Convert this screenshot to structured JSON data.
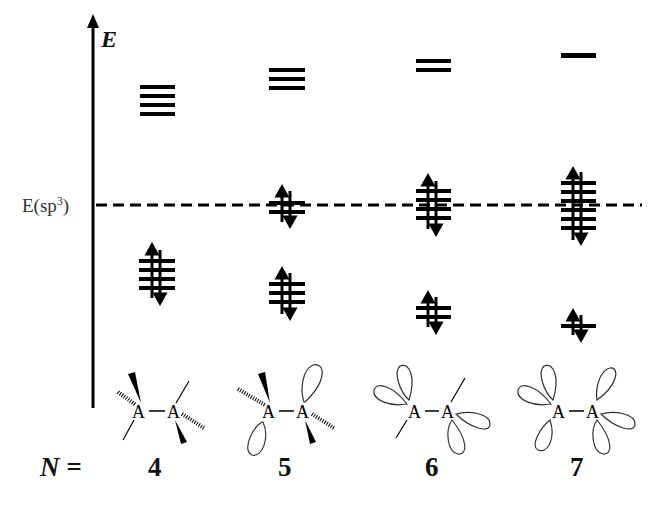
{
  "diagram": {
    "axis_label": "E",
    "reference_level": {
      "label_prefix": "E(sp",
      "label_sup": "3",
      "label_suffix": ")"
    },
    "n_label": "N =",
    "columns": [
      {
        "n": "4",
        "upper_levels": 4,
        "middle_levels": 0,
        "lower_levels": 4,
        "structure": "4 bonds (2 wedge, 2 hash, 2 plain), no lone pairs"
      },
      {
        "n": "5",
        "upper_levels": 3,
        "middle_levels": 2,
        "lower_levels": 3,
        "structure": "3 bonds + 1 lone pair lobe per side alternating"
      },
      {
        "n": "6",
        "upper_levels": 2,
        "middle_levels": 4,
        "lower_levels": 2,
        "structure": "2 plain bonds + 4 lone pair lobes"
      },
      {
        "n": "7",
        "upper_levels": 1,
        "middle_levels": 6,
        "lower_levels": 1,
        "structure": "6 lone pair lobes"
      }
    ],
    "colors": {
      "ink": "#000000",
      "background": "#ffffff"
    }
  }
}
